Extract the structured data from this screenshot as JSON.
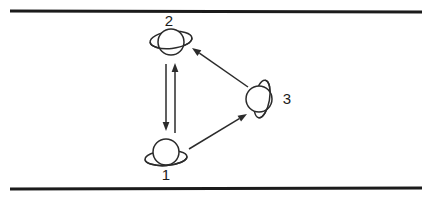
{
  "figure": {
    "type": "node-link-diagram",
    "background_color": "#ffffff",
    "ink_color": "#2b2b2b",
    "rule_color": "#1b1b1b",
    "rules": [
      {
        "name": "top-rule",
        "x1": 10,
        "y1": 11,
        "x2": 422,
        "y2": 12
      },
      {
        "name": "bottom-rule",
        "x1": 10,
        "y1": 189,
        "x2": 422,
        "y2": 188
      }
    ],
    "nodes": [
      {
        "id": "1",
        "label": "1",
        "icon": "planet-with-ring-icon",
        "cx": 166,
        "cy": 152,
        "r": 13,
        "ring": {
          "rx": 21,
          "ry": 7.5,
          "cx": 166,
          "cy": 158,
          "rotate": -4
        },
        "label_x": 166,
        "label_y": 176
      },
      {
        "id": "2",
        "label": "2",
        "icon": "planet-with-ring-icon",
        "cx": 171,
        "cy": 42,
        "r": 13,
        "ring": {
          "rx": 21,
          "ry": 8.5,
          "cx": 171,
          "cy": 40,
          "rotate": -6
        },
        "label_x": 169,
        "label_y": 22
      },
      {
        "id": "3",
        "label": "3",
        "icon": "planet-with-vertical-ring-icon",
        "cx": 259,
        "cy": 99,
        "r": 13,
        "ring": {
          "rx": 7.5,
          "ry": 19,
          "cx": 262,
          "cy": 99,
          "rotate": 10
        },
        "label_x": 287,
        "label_y": 100
      }
    ],
    "edges": [
      {
        "name": "edge-2-to-1",
        "from": "2",
        "to": "1",
        "direction": "down",
        "x1": 166,
        "y1": 64,
        "x2": 166,
        "y2": 131,
        "arrow_at": "target"
      },
      {
        "name": "edge-1-to-2",
        "from": "1",
        "to": "2",
        "direction": "up",
        "x1": 175,
        "y1": 133,
        "x2": 175,
        "y2": 63,
        "arrow_at": "target"
      },
      {
        "name": "edge-3-to-2",
        "from": "3",
        "to": "2",
        "direction": "upper-left",
        "x1": 248,
        "y1": 87,
        "x2": 192,
        "y2": 48,
        "arrow_at": "target"
      },
      {
        "name": "edge-1-to-3",
        "from": "1",
        "to": "3",
        "direction": "upper-right",
        "x1": 189,
        "y1": 149,
        "x2": 247,
        "y2": 114,
        "arrow_at": "target"
      }
    ]
  }
}
